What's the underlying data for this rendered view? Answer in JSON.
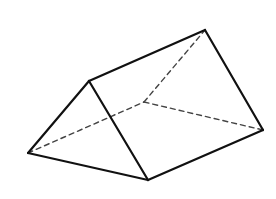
{
  "diagram": {
    "type": "triangular-prism",
    "background": "#ffffff",
    "stroke_color": "#111111",
    "hidden_stroke_color": "#444444",
    "vertices": {
      "A": [
        28,
        153
      ],
      "B": [
        89,
        81
      ],
      "C": [
        148,
        180
      ],
      "D": [
        205,
        30
      ],
      "E": [
        263,
        130
      ],
      "F": [
        144,
        102
      ]
    },
    "visible_edges": [
      [
        "A",
        "B"
      ],
      [
        "B",
        "C"
      ],
      [
        "C",
        "A"
      ],
      [
        "B",
        "D"
      ],
      [
        "D",
        "E"
      ],
      [
        "E",
        "C"
      ]
    ],
    "hidden_edges": [
      [
        "A",
        "F"
      ],
      [
        "F",
        "D"
      ],
      [
        "F",
        "E"
      ]
    ]
  }
}
